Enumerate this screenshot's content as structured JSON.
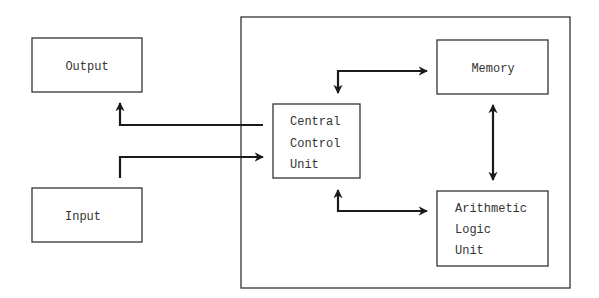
{
  "diagram": {
    "title": "",
    "nodes": [
      {
        "id": "output",
        "lines": [
          "Output"
        ]
      },
      {
        "id": "input",
        "lines": [
          "Input"
        ]
      },
      {
        "id": "ccu",
        "lines": [
          "Central",
          "Control",
          "Unit"
        ]
      },
      {
        "id": "memory",
        "lines": [
          "Memory"
        ]
      },
      {
        "id": "alu",
        "lines": [
          "Arithmetic",
          "Logic",
          "Unit"
        ]
      }
    ],
    "edges": [
      {
        "from": "ccu",
        "to": "output",
        "direction": "one-way"
      },
      {
        "from": "input",
        "to": "ccu",
        "direction": "one-way"
      },
      {
        "from": "ccu",
        "to": "memory",
        "direction": "two-way"
      },
      {
        "from": "memory",
        "to": "alu",
        "direction": "two-way"
      },
      {
        "from": "ccu",
        "to": "alu",
        "direction": "two-way"
      }
    ],
    "groups": [
      {
        "id": "processor-enclosure",
        "contains": [
          "ccu",
          "memory",
          "alu"
        ]
      }
    ],
    "colors": {
      "stroke": "#333333",
      "arrow": "#1a1a1a",
      "background": "#ffffff"
    }
  }
}
